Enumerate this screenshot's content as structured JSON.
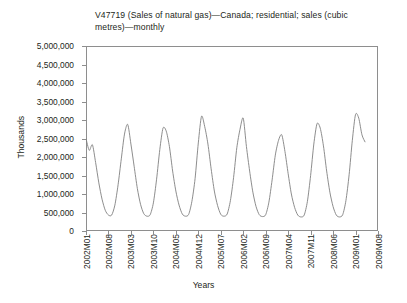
{
  "chart": {
    "title": "V47719 (Sales of natural gas)—Canada; residential; sales (cubic metres)—monthly",
    "y_axis_title": "Thousands",
    "x_axis_title": "Years",
    "line_color": "#808080",
    "frame_color": "#8e8e8e",
    "background": "#ffffff"
  },
  "chart_data": {
    "type": "line",
    "title": "V47719 (Sales of natural gas)—Canada; residential; sales (cubic metres)—monthly",
    "xlabel": "Years",
    "ylabel": "Thousands",
    "ylim": [
      0,
      5000000
    ],
    "yticks": [
      0,
      500000,
      1000000,
      1500000,
      2000000,
      2500000,
      3000000,
      3500000,
      4000000,
      4500000,
      5000000
    ],
    "ytick_labels": [
      "0",
      "500,000",
      "1,000,000",
      "1,500,000",
      "2,000,000",
      "2,500,000",
      "3,000,000",
      "3,500,000",
      "4,000,000",
      "4,500,000",
      "5,000,000"
    ],
    "xtick_labels": [
      "2002M01",
      "2002M08",
      "2003M03",
      "2003M10",
      "2004M05",
      "2004M12",
      "2005M07",
      "2006M02",
      "2006M09",
      "2007M04",
      "2007M11",
      "2008M06",
      "2009M01",
      "2009M08"
    ],
    "xtick_indices": [
      0,
      7,
      14,
      21,
      28,
      35,
      42,
      49,
      56,
      63,
      70,
      77,
      84,
      91
    ],
    "x_index_min": 0,
    "x_index_max": 91,
    "grid": false,
    "legend": "none",
    "series": [
      {
        "name": "V47719 residential natural gas sales",
        "x": [
          "2002M01",
          "2002M02",
          "2002M03",
          "2002M04",
          "2002M05",
          "2002M06",
          "2002M07",
          "2002M08",
          "2002M09",
          "2002M10",
          "2002M11",
          "2002M12",
          "2003M01",
          "2003M02",
          "2003M03",
          "2003M04",
          "2003M05",
          "2003M06",
          "2003M07",
          "2003M08",
          "2003M09",
          "2003M10",
          "2003M11",
          "2003M12",
          "2004M01",
          "2004M02",
          "2004M03",
          "2004M04",
          "2004M05",
          "2004M06",
          "2004M07",
          "2004M08",
          "2004M09",
          "2004M10",
          "2004M11",
          "2004M12",
          "2005M01",
          "2005M02",
          "2005M03",
          "2005M04",
          "2005M05",
          "2005M06",
          "2005M07",
          "2005M08",
          "2005M09",
          "2005M10",
          "2005M11",
          "2005M12",
          "2006M01",
          "2006M02",
          "2006M03",
          "2006M04",
          "2006M05",
          "2006M06",
          "2006M07",
          "2006M08",
          "2006M09",
          "2006M10",
          "2006M11",
          "2006M12",
          "2007M01",
          "2007M02",
          "2007M03",
          "2007M04",
          "2007M05",
          "2007M06",
          "2007M07",
          "2007M08",
          "2007M09",
          "2007M10",
          "2007M11",
          "2007M12",
          "2008M01",
          "2008M02",
          "2008M03",
          "2008M04",
          "2008M05",
          "2008M06",
          "2008M07",
          "2008M08",
          "2008M09",
          "2008M10",
          "2008M11",
          "2008M12",
          "2009M01",
          "2009M02",
          "2009M03",
          "2009M04"
        ],
        "values": [
          2500000,
          2180000,
          2330000,
          1850000,
          1300000,
          860000,
          560000,
          430000,
          430000,
          700000,
          1250000,
          1950000,
          2620000,
          2880000,
          2350000,
          1750000,
          1150000,
          720000,
          470000,
          400000,
          440000,
          760000,
          1400000,
          2200000,
          2780000,
          2700000,
          2280000,
          1620000,
          1080000,
          700000,
          460000,
          400000,
          450000,
          800000,
          1420000,
          2380000,
          3100000,
          2820000,
          2350000,
          1680000,
          1080000,
          690000,
          450000,
          400000,
          460000,
          820000,
          1450000,
          2250000,
          2750000,
          3050000,
          2280000,
          1620000,
          1050000,
          660000,
          440000,
          390000,
          440000,
          780000,
          1380000,
          2050000,
          2450000,
          2600000,
          2150000,
          1550000,
          1000000,
          640000,
          430000,
          380000,
          430000,
          800000,
          1500000,
          2350000,
          2900000,
          2780000,
          2300000,
          1620000,
          1050000,
          660000,
          430000,
          380000,
          440000,
          820000,
          1520000,
          2450000,
          3150000,
          3050000,
          2600000,
          2400000
        ]
      }
    ]
  }
}
